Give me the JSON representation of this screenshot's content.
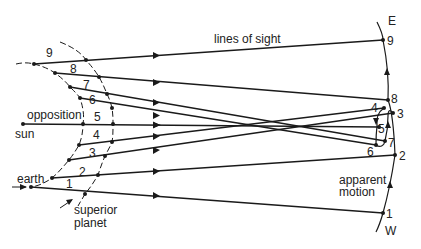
{
  "diagram": {
    "labels": {
      "lines_of_sight": "lines of sight",
      "opposition": "opposition",
      "sun": "sun",
      "earth": "earth",
      "superior_planet_line1": "superior",
      "superior_planet_line2": "planet",
      "apparent_motion_line1": "apparent",
      "apparent_motion_line2": "motion",
      "east": "E",
      "west": "W"
    },
    "earth_positions": [
      "1",
      "2",
      "3",
      "4",
      "5",
      "6",
      "7",
      "8",
      "9"
    ],
    "planet_positions": [
      "1",
      "2",
      "3",
      "4",
      "5",
      "6",
      "7",
      "8",
      "9"
    ],
    "sky_positions": {
      "p1": "1",
      "p2": "2",
      "p3": "3",
      "p4": "4",
      "p5": "5",
      "p6": "6",
      "p7": "7",
      "p8": "8",
      "p9": "9"
    },
    "segment_labels": {
      "s1": "1",
      "s2": "2",
      "s3": "3",
      "s4": "4",
      "s5": "5",
      "s6": "6",
      "s7": "7",
      "s8": "8",
      "s9": "9"
    },
    "colors": {
      "ink": "#1a1a1a",
      "background": "#ffffff"
    }
  }
}
